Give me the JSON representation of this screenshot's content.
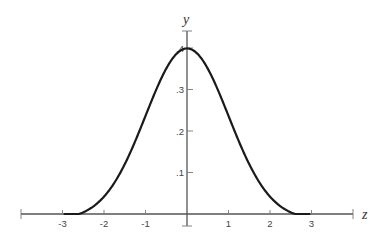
{
  "chart_data": {
    "type": "line",
    "title": "",
    "xlabel": "z",
    "ylabel": "y",
    "xlim": [
      -4,
      4
    ],
    "ylim": [
      0,
      0.4
    ],
    "grid": false,
    "legend": null,
    "x_ticks": [
      -3,
      -2,
      -1,
      1,
      2,
      3
    ],
    "x_tick_labels": [
      "-3",
      "-2",
      "-1",
      "1",
      "2",
      "3"
    ],
    "y_ticks": [
      0.1,
      0.2,
      0.3,
      0.4
    ],
    "y_tick_labels": [
      ".1",
      ".2",
      ".3",
      ".4"
    ],
    "series": [
      {
        "name": "standard normal density",
        "x": [
          -2.6,
          -2.4,
          -2.2,
          -2.0,
          -1.8,
          -1.6,
          -1.4,
          -1.2,
          -1.0,
          -0.8,
          -0.6,
          -0.4,
          -0.2,
          0.0,
          0.2,
          0.4,
          0.6,
          0.8,
          1.0,
          1.2,
          1.4,
          1.6,
          1.8,
          2.0,
          2.2,
          2.4,
          2.6
        ],
        "values": [
          0.0,
          0.01,
          0.03,
          0.054,
          0.079,
          0.111,
          0.15,
          0.194,
          0.242,
          0.29,
          0.333,
          0.368,
          0.391,
          0.399,
          0.391,
          0.368,
          0.333,
          0.29,
          0.242,
          0.194,
          0.15,
          0.111,
          0.079,
          0.054,
          0.03,
          0.01,
          0.0
        ]
      }
    ],
    "colors": {
      "curve": "#1a1a1a",
      "axis": "#555555",
      "text": "#444444"
    }
  }
}
